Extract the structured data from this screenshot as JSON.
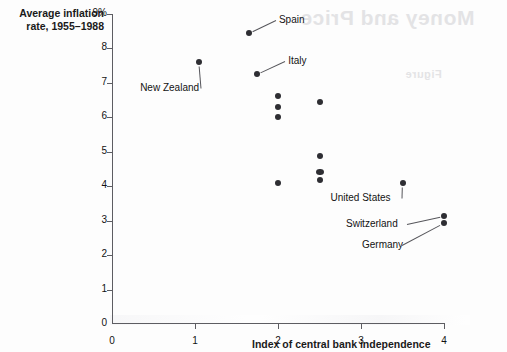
{
  "figure": {
    "ghost_overlay_top": "Money and Price",
    "ghost_overlay_sub": "Figure"
  },
  "axes": {
    "y_title": "Average inflation rate, 1955–1988",
    "y_title_line1": "Average inflation",
    "y_title_line2": "rate, 1955–1988",
    "x_title": "Index of central bank independence",
    "y_ticks": [
      "0",
      "1",
      "2",
      "3",
      "4",
      "5",
      "6",
      "7",
      "8",
      "9%"
    ],
    "x_ticks": [
      "0",
      "1",
      "2",
      "3",
      "4"
    ]
  },
  "chart_data": {
    "type": "scatter",
    "title": "",
    "xlabel": "Index of central bank independence",
    "ylabel": "Average inflation rate, 1955–1988",
    "xlim": [
      0,
      4
    ],
    "ylim": [
      0,
      9
    ],
    "grid": false,
    "legend": "none",
    "x_tick_values": [
      0,
      1,
      2,
      3,
      4
    ],
    "y_tick_values": [
      0,
      1,
      2,
      3,
      4,
      5,
      6,
      7,
      8,
      9
    ],
    "y_unit": "%",
    "points": [
      {
        "label": "Spain",
        "x": 1.65,
        "y": 8.45,
        "labeled": true,
        "label_dx": 30,
        "label_dy": -13,
        "shape": "dot"
      },
      {
        "label": "New Zealand",
        "x": 1.05,
        "y": 7.6,
        "labeled": true,
        "label_dx": -59,
        "label_dy": 26,
        "shape": "dot"
      },
      {
        "label": "Italy",
        "x": 1.75,
        "y": 7.25,
        "labeled": true,
        "label_dx": 31,
        "label_dy": -13,
        "shape": "dot"
      },
      {
        "label": "",
        "x": 2.0,
        "y": 6.62,
        "labeled": false,
        "shape": "dot"
      },
      {
        "label": "",
        "x": 2.0,
        "y": 6.3,
        "labeled": false,
        "shape": "dot"
      },
      {
        "label": "",
        "x": 2.0,
        "y": 6.0,
        "labeled": false,
        "shape": "dot"
      },
      {
        "label": "",
        "x": 2.5,
        "y": 6.45,
        "labeled": false,
        "shape": "dot"
      },
      {
        "label": "",
        "x": 2.5,
        "y": 4.88,
        "labeled": false,
        "shape": "dot"
      },
      {
        "label": "",
        "x": 2.5,
        "y": 4.42,
        "labeled": false,
        "shape": "wide"
      },
      {
        "label": "",
        "x": 2.5,
        "y": 4.18,
        "labeled": false,
        "shape": "dot"
      },
      {
        "label": "",
        "x": 2.0,
        "y": 4.08,
        "labeled": false,
        "shape": "dot"
      },
      {
        "label": "United States",
        "x": 3.5,
        "y": 4.08,
        "labeled": true,
        "label_dx": -72,
        "label_dy": 15,
        "shape": "dot"
      },
      {
        "label": "Switzerland",
        "x": 4.0,
        "y": 3.15,
        "labeled": true,
        "label_dx": -98,
        "label_dy": 8,
        "shape": "dot"
      },
      {
        "label": "Germany",
        "x": 4.0,
        "y": 2.92,
        "labeled": true,
        "label_dx": -82,
        "label_dy": 22,
        "shape": "dot"
      }
    ]
  }
}
